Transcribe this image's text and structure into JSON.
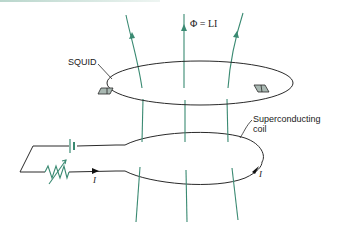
{
  "diagram": {
    "labels": {
      "squid": "SQUID",
      "flux_equation": "Φ = LI",
      "coil_line1": "Superconducting",
      "coil_line2": "coil",
      "current_circuit": "I",
      "current_coil": "I"
    },
    "colors": {
      "field_lines": "#3a8a72",
      "wires": "#2a2a2a",
      "squid_fill": "#a9b8b2",
      "resistor": "#3a8a72",
      "battery": "#3a8a72"
    },
    "components": [
      "upper superconducting loop with two SQUID junctions",
      "lower superconducting coil",
      "battery",
      "variable resistor",
      "magnetic field lines"
    ]
  }
}
